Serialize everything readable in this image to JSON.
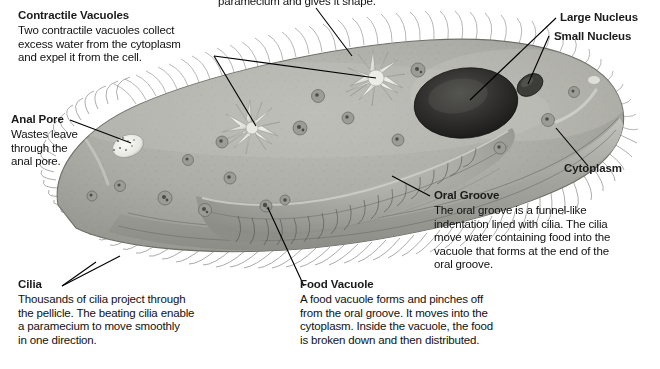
{
  "figure": {
    "partial_top_caption": "paramecium and gives it shape."
  },
  "palette": {
    "cytoplasm": "#a9a9a4",
    "cytoplasm_light": "#c3c3bd",
    "pellicle": "#8f8f89",
    "nucleus_large": "#2b2b2b",
    "nucleus_small": "#4a4a48",
    "vacuole_star": "#e4e4de",
    "anal_pore": "#f2f2ee",
    "cilia": "#6f6f6c",
    "leader_line": "#000000",
    "text": "#111111",
    "background": "#ffffff"
  },
  "callouts": [
    {
      "id": "contractile-vacuoles",
      "title": "Contractile Vacuoles",
      "lines": [
        "Two contractile vacuoles collect",
        "excess water from the cytoplasm",
        "and expel it from the cell."
      ]
    },
    {
      "id": "anal-pore",
      "title": "Anal Pore",
      "lines": [
        "Wastes leave",
        "through the",
        "anal pore."
      ]
    },
    {
      "id": "cilia",
      "title": "Cilia",
      "lines": [
        "Thousands of cilia project through",
        "the pellicle. The beating cilia enable",
        "a paramecium to move smoothly",
        "in one direction."
      ]
    },
    {
      "id": "food-vacuole",
      "title": "Food Vacuole",
      "lines": [
        "A food vacuole forms and pinches off",
        "from the oral groove. It moves into the",
        "cytoplasm. Inside the vacuole, the food",
        "is broken down and then distributed."
      ]
    },
    {
      "id": "oral-groove",
      "title": "Oral Groove",
      "lines": [
        "The oral groove is a funnel-like",
        "indentation lined with cilia. The cilia",
        "move water containing food into the",
        "vacuole that forms at the end of the",
        "oral groove."
      ]
    },
    {
      "id": "large-nucleus",
      "title": "Large Nucleus",
      "lines": []
    },
    {
      "id": "small-nucleus",
      "title": "Small Nucleus",
      "lines": []
    },
    {
      "id": "cytoplasm",
      "title": "Cytoplasm",
      "lines": []
    }
  ]
}
